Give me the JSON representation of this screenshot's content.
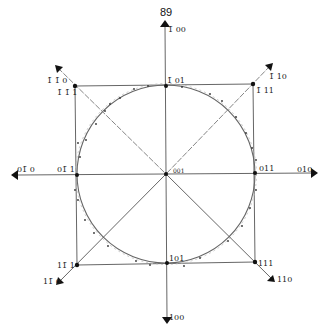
{
  "figure": {
    "number_label": "89",
    "center": {
      "x": 166,
      "y": 174
    },
    "circle_radius": 89,
    "colors": {
      "line": "#555555",
      "dashed": "#888888",
      "circle": "#666666",
      "point": "#111111",
      "arrow": "#111111",
      "scatter": "#999999"
    }
  },
  "labels": {
    "top_axis": "1̄ 00",
    "bottom_axis": "100",
    "left_axis": "01̄ 0",
    "right_axis": "010",
    "center": "001",
    "top_mid": "1̄ 01",
    "bottom_mid": "101",
    "left_mid": "01̄ 1",
    "right_mid": "011",
    "corner_tl_dir": "1̄ 1̄ 0",
    "corner_tl_pt": "1̄ 1̄ 1",
    "corner_tr_dir": "1̄ 10",
    "corner_tr_pt": "1̄ 11",
    "corner_bl_dir": "11̄ 0",
    "corner_bl_pt": "11̄ 1",
    "corner_br_dir": "110",
    "corner_br_pt": "111"
  },
  "points": [
    {
      "name": "center",
      "x": 166,
      "y": 174
    },
    {
      "name": "top-mid",
      "x": 166,
      "y": 86
    },
    {
      "name": "bottom-mid",
      "x": 167,
      "y": 263
    },
    {
      "name": "left-mid",
      "x": 77,
      "y": 175
    },
    {
      "name": "right-mid",
      "x": 255,
      "y": 173
    },
    {
      "name": "corner-tl",
      "x": 75,
      "y": 86
    },
    {
      "name": "corner-tr",
      "x": 253,
      "y": 84
    },
    {
      "name": "corner-bl",
      "x": 77,
      "y": 265
    },
    {
      "name": "corner-br",
      "x": 255,
      "y": 262
    }
  ]
}
